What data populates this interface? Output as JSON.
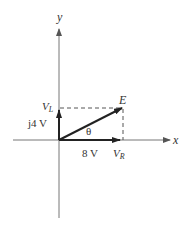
{
  "diagram": {
    "type": "phasor-diagram",
    "axes": {
      "x_label": "x",
      "y_label": "y"
    },
    "phasor": {
      "label": "E",
      "angle_label": "θ"
    },
    "components": {
      "real": {
        "value_label": "8 V",
        "name_main": "V",
        "name_sub": "R"
      },
      "imag": {
        "value_label": "j4 V",
        "name_main": "V",
        "name_sub": "L"
      }
    },
    "colors": {
      "axis": "#777777",
      "vector": "#333333",
      "dashed": "#555555",
      "text": "#333333"
    }
  }
}
